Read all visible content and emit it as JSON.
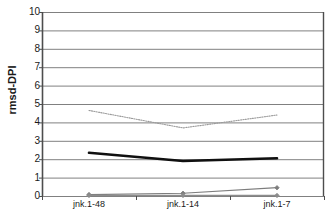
{
  "chart_data": {
    "type": "line",
    "title": "",
    "xlabel": "",
    "ylabel": "rmsd-DPI",
    "categories": [
      "jnk.1-48",
      "jnk.1-14",
      "jnk.1-7"
    ],
    "ylim": [
      0,
      10
    ],
    "yticks": [
      0,
      1,
      2,
      3,
      4,
      5,
      6,
      7,
      8,
      9,
      10
    ],
    "ytick_labels": [
      "0",
      "1",
      "2",
      "3",
      "4",
      "5",
      "6",
      "7",
      "8",
      "9",
      "10"
    ],
    "grid": true,
    "grid_axis": "y",
    "legend": false,
    "legend_position": "none",
    "series": [
      {
        "name": "dotted-upper",
        "style": "dotted",
        "color": "#9a9a9a",
        "marker": "none",
        "values": [
          4.65,
          3.7,
          4.4
        ]
      },
      {
        "name": "solid-bold-middle",
        "style": "solid-bold",
        "color": "#101010",
        "marker": "none",
        "values": [
          2.35,
          1.9,
          2.05
        ]
      },
      {
        "name": "marker-lower",
        "style": "solid-thin",
        "color": "#7d7d7d",
        "marker": "diamond",
        "values": [
          0.08,
          0.15,
          0.45
        ]
      },
      {
        "name": "baseline",
        "style": "solid-thin",
        "color": "#8c8c8c",
        "marker": "diamond",
        "values": [
          0.03,
          0.03,
          0.03
        ]
      }
    ]
  },
  "axes": {
    "y_axis_title": "rmsd-DPI"
  },
  "colors": {
    "grid": "#808080",
    "axis": "#4d4d4d",
    "text": "#1a1a1a",
    "series_dotted": "#9a9a9a",
    "series_bold": "#101010",
    "series_marker": "#7d7d7d",
    "series_baseline": "#8c8c8c"
  }
}
